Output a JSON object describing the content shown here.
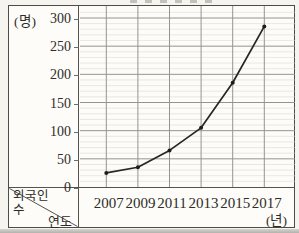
{
  "axis": {
    "y_unit": "(명)",
    "x_unit": "(년)",
    "corner": {
      "row_line1": "외국인",
      "row_line2": "수",
      "col": "연도"
    }
  },
  "chart_data": {
    "type": "line",
    "x": [
      "2007",
      "2009",
      "2011",
      "2013",
      "2015",
      "2017"
    ],
    "values": [
      25,
      35,
      65,
      105,
      185,
      285
    ],
    "x_axis_label": "연도",
    "y_axis_label": "외국인 수",
    "x_unit_label": "(년)",
    "y_unit_label": "(명)",
    "y_ticks": [
      "0",
      "50",
      "100",
      "150",
      "200",
      "250",
      "300"
    ],
    "ylim": [
      0,
      300
    ],
    "legend": "none",
    "grid": {
      "horizontal_minor_step": 10,
      "horizontal_major_step": 50,
      "vertical_lines": "one per year"
    }
  },
  "colors": {
    "paper": "#f6f4ef",
    "plot_background": "#fdfcf9",
    "frame_border": "#4e4c48",
    "grid_major": "#96948e",
    "grid_minor": "#d8d6d0",
    "line": "#262626",
    "text": "#2e2c28"
  }
}
